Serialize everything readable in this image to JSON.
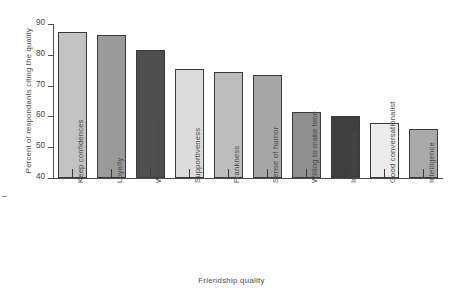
{
  "chart_data": {
    "type": "bar",
    "title": "",
    "xlabel": "Friendship quality",
    "ylabel": "Percent of respondants citing the quality",
    "ylim": [
      40,
      90
    ],
    "yticks": [
      40,
      50,
      60,
      70,
      80,
      90
    ],
    "grid": false,
    "legend": "none",
    "categories": [
      "Keep confidences",
      "Loyalty",
      "Warmth, affection",
      "Supportiveness",
      "Frankness",
      "Sense of humor",
      "Willing to make time",
      "Independence",
      "Good conversationalist",
      "Intelligence"
    ],
    "values": [
      87.5,
      86.5,
      81.5,
      75.5,
      74.5,
      73.5,
      61.5,
      60,
      58,
      56
    ],
    "bar_colors": [
      "#c3c3c3",
      "#9a9a9a",
      "#4f4f4f",
      "#dcdcdc",
      "#bdbdbd",
      "#a6a6a6",
      "#8f8f8f",
      "#3f3f3f",
      "#ececec",
      "#a9a9a9"
    ]
  },
  "axis": {
    "tick_labels": [
      "90",
      "80",
      "70",
      "60",
      "50",
      "40"
    ]
  }
}
